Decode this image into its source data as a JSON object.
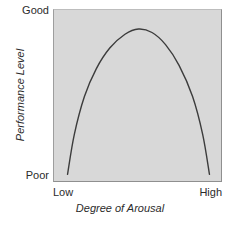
{
  "chart_data": {
    "type": "line",
    "title": "",
    "xlabel": "Degree of Arousal",
    "ylabel": "Performance Level",
    "x_tick_labels": [
      "Low",
      "High"
    ],
    "y_tick_labels": [
      "Poor",
      "Good"
    ],
    "xlim": [
      0,
      100
    ],
    "ylim": [
      0,
      100
    ],
    "grid": false,
    "legend": null,
    "series": [
      {
        "name": "Arousal vs Performance",
        "x": [
          8,
          12,
          18,
          25,
          33,
          42,
          50,
          58,
          66,
          74,
          82,
          88,
          92
        ],
        "y": [
          5,
          28,
          50,
          66,
          78,
          86,
          89,
          87,
          80,
          68,
          50,
          28,
          5
        ]
      }
    ],
    "curve_color": "#3c3c3c",
    "panel_color": "#d8d8d8",
    "background_color": "#ffffff",
    "annotations": []
  },
  "axes": {
    "y_top_label": "Good",
    "y_bottom_label": "Poor",
    "y_title": "Performance Level",
    "x_left_label": "Low",
    "x_right_label": "High",
    "x_title": "Degree of Arousal"
  }
}
